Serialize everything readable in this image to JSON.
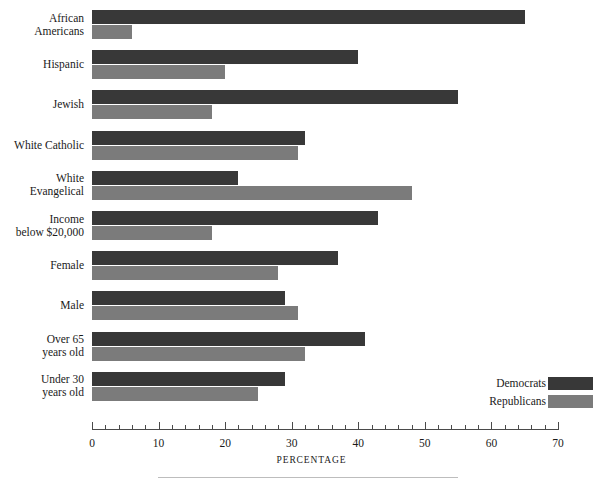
{
  "chart_data": {
    "type": "bar",
    "orientation": "horizontal",
    "title": "",
    "xlabel": "PERCENTAGE",
    "ylabel": "",
    "xlim": [
      0,
      70
    ],
    "xticks": [
      0,
      10,
      20,
      30,
      40,
      50,
      60,
      70
    ],
    "xtick_labels": [
      "0",
      "10",
      "20",
      "30",
      "40",
      "50",
      "60",
      "70"
    ],
    "minor_tick_step": 2,
    "grid": false,
    "legend_position": "bottom-right",
    "categories": [
      "African\nAmericans",
      "Hispanic",
      "Jewish",
      "White Catholic",
      "White\nEvangelical",
      "Income\nbelow $20,000",
      "Female",
      "Male",
      "Over 65\nyears old",
      "Under 30\nyears old"
    ],
    "category_lines": [
      [
        "African",
        "Americans"
      ],
      [
        "Hispanic"
      ],
      [
        "Jewish"
      ],
      [
        "White Catholic"
      ],
      [
        "White",
        "Evangelical"
      ],
      [
        "Income",
        "below $20,000"
      ],
      [
        "Female"
      ],
      [
        "Male"
      ],
      [
        "Over 65",
        "years old"
      ],
      [
        "Under 30",
        "years old"
      ]
    ],
    "series": [
      {
        "name": "Democrats",
        "color": "#383838",
        "values": [
          65,
          40,
          55,
          32,
          22,
          43,
          37,
          29,
          41,
          29
        ]
      },
      {
        "name": "Republicans",
        "color": "#7b7b7b",
        "values": [
          6,
          20,
          18,
          31,
          48,
          18,
          28,
          31,
          32,
          25
        ]
      }
    ]
  },
  "legend": {
    "items": [
      {
        "label": "Democrats",
        "color": "#383838"
      },
      {
        "label": "Republicans",
        "color": "#7b7b7b"
      }
    ]
  },
  "axis": {
    "title": "PERCENTAGE"
  },
  "colors": {
    "democrat": "#383838",
    "republican": "#7b7b7b",
    "axis": "#4a4a4a",
    "text": "#1a1a1a",
    "rule": "#bdbdbd",
    "background": "#ffffff"
  }
}
